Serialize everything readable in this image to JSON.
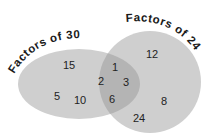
{
  "diagram": {
    "type": "venn",
    "colors": {
      "set_fill": "#cfcfcf",
      "overlap_fill": "#b6b6b6",
      "text": "#222222"
    },
    "sets": [
      {
        "label": "Factors of 30",
        "only": [
          "15",
          "5",
          "10"
        ]
      },
      {
        "label": "Factors of 24",
        "only": [
          "12",
          "8",
          "24"
        ]
      }
    ],
    "intersection": [
      "1",
      "2",
      "3",
      "6"
    ],
    "numbers": {
      "n15": "15",
      "n5": "5",
      "n10": "10",
      "n1": "1",
      "n2": "2",
      "n3": "3",
      "n6": "6",
      "n12": "12",
      "n8": "8",
      "n24": "24"
    }
  }
}
